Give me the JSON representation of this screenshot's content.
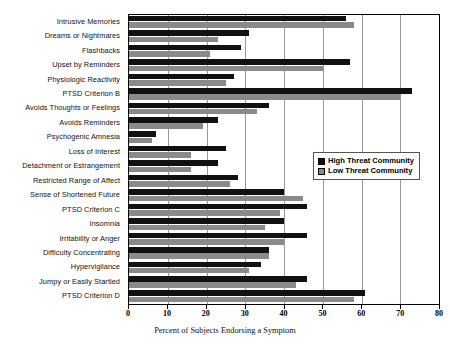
{
  "chart_data": {
    "type": "bar",
    "orientation": "horizontal",
    "title": "",
    "xlabel": "Percent of Subjects Endorsing a Symptom",
    "ylabel": "",
    "xlim": [
      0,
      80
    ],
    "xticks": [
      0,
      10,
      20,
      30,
      40,
      50,
      60,
      70,
      80
    ],
    "grid": true,
    "legend_position": "center-right",
    "categories": [
      "Intrusive Memories",
      "Dreams or Nightmares",
      "Flashbacks",
      "Upset by Reminders",
      "Physiologic Reactivity",
      "PTSD Criterion B",
      "Avoids Thoughts or Feelings",
      "Avoids Reminders",
      "Psychogenic Amnesia",
      "Loss of Interest",
      "Detachment or Estrangement",
      "Restricted Range of Affect",
      "Sense of Shortened Future",
      "PTSD Criterion C",
      "Insomnia",
      "Irritability or Anger",
      "Difficulty Concentrating",
      "Hypervigilance",
      "Jumpy or Easily Startled",
      "PTSD Criterion D"
    ],
    "series": [
      {
        "name": "High Threat Community",
        "color": "#111111",
        "values": [
          56,
          31,
          29,
          57,
          27,
          73,
          36,
          23,
          7,
          25,
          23,
          28,
          40,
          46,
          40,
          46,
          36,
          34,
          46,
          61
        ]
      },
      {
        "name": "Low Threat Community",
        "color": "#8a8a8a",
        "values": [
          58,
          23,
          21,
          50,
          25,
          70,
          33,
          19,
          6,
          16,
          16,
          26,
          45,
          39,
          35,
          40,
          36,
          31,
          43,
          58
        ]
      }
    ]
  },
  "legend": {
    "entries": [
      {
        "label": "High Threat Community"
      },
      {
        "label": "Low Threat Community"
      }
    ]
  },
  "axis": {
    "x_title": "Percent of Subjects Endorsing a Symptom"
  }
}
